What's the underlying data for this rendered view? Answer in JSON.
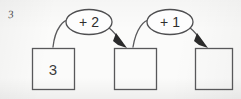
{
  "worksheet": {
    "question_number": "3",
    "width": 241,
    "height": 99,
    "background_color": "#fbfbfa",
    "ink_color": "#58585a"
  },
  "diagram": {
    "type": "function-machine-chain",
    "boxes": [
      {
        "name": "start-box",
        "value": "3",
        "filled": true,
        "x": 32,
        "y": 48,
        "w": 42,
        "h": 41
      },
      {
        "name": "middle-box",
        "value": "",
        "filled": false,
        "x": 114,
        "y": 48,
        "w": 42,
        "h": 41
      },
      {
        "name": "end-box",
        "value": "",
        "filled": false,
        "x": 195,
        "y": 48,
        "w": 37,
        "h": 41
      }
    ],
    "operations": [
      {
        "name": "operation-add-2",
        "label": "+ 2",
        "cx": 89,
        "cy": 22,
        "rx": 23,
        "ry": 12
      },
      {
        "name": "operation-add-1",
        "label": "+ 1",
        "cx": 170,
        "cy": 22,
        "rx": 23,
        "ry": 12
      }
    ],
    "arrows": [
      {
        "name": "arrow-box1-to-box2",
        "from": "start-box",
        "to": "middle-box"
      },
      {
        "name": "arrow-box2-to-box3",
        "from": "middle-box",
        "to": "end-box"
      }
    ]
  }
}
